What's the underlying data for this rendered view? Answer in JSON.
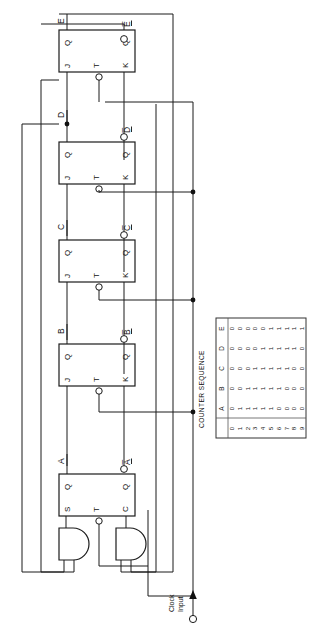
{
  "figure": {
    "orientation": "rotated-90"
  },
  "clock": {
    "label_line1": "Clock",
    "label_line2": "Input"
  },
  "stages": [
    {
      "id": "A",
      "type": "STC",
      "q_label": "A",
      "qbar_label": "A̅",
      "pins": {
        "in1": "S",
        "trigger": "T",
        "in2": "C",
        "out_q": "Q",
        "out_qbar": "Q"
      },
      "gates": [
        "and-gate-set",
        "and-gate-clear"
      ]
    },
    {
      "id": "B",
      "type": "JTK",
      "q_label": "B",
      "qbar_label": "B̅",
      "pins": {
        "in1": "J",
        "trigger": "T",
        "in2": "K",
        "out_q": "Q",
        "out_qbar": "Q"
      }
    },
    {
      "id": "C",
      "type": "JTK",
      "q_label": "C",
      "qbar_label": "C̅",
      "pins": {
        "in1": "J",
        "trigger": "T",
        "in2": "K",
        "out_q": "Q",
        "out_qbar": "Q"
      }
    },
    {
      "id": "D",
      "type": "JTK",
      "q_label": "D",
      "qbar_label": "D̅",
      "pins": {
        "in1": "J",
        "trigger": "T",
        "in2": "K",
        "out_q": "Q",
        "out_qbar": "Q"
      }
    },
    {
      "id": "E",
      "type": "JTK",
      "q_label": "E",
      "qbar_label": "E̅",
      "pins": {
        "in1": "J",
        "trigger": "T",
        "in2": "K",
        "out_q": "Q",
        "out_qbar": "Q"
      }
    }
  ],
  "table": {
    "caption": "COUNTER SEQUENCE",
    "count_header": "",
    "columns": [
      "A",
      "B",
      "C",
      "D",
      "E"
    ],
    "counts": [
      "0",
      "1",
      "2",
      "3",
      "4",
      "5",
      "6",
      "7",
      "8",
      "9"
    ],
    "rows": [
      {
        "count": "0",
        "A": "0",
        "B": "0",
        "C": "0",
        "D": "0",
        "E": "0"
      },
      {
        "count": "1",
        "A": "1",
        "B": "0",
        "C": "0",
        "D": "0",
        "E": "0"
      },
      {
        "count": "2",
        "A": "1",
        "B": "1",
        "C": "0",
        "D": "0",
        "E": "0"
      },
      {
        "count": "3",
        "A": "1",
        "B": "1",
        "C": "1",
        "D": "0",
        "E": "0"
      },
      {
        "count": "4",
        "A": "1",
        "B": "1",
        "C": "1",
        "D": "1",
        "E": "0"
      },
      {
        "count": "5",
        "A": "1",
        "B": "1",
        "C": "1",
        "D": "1",
        "E": "1"
      },
      {
        "count": "6",
        "A": "0",
        "B": "1",
        "C": "1",
        "D": "1",
        "E": "1"
      },
      {
        "count": "7",
        "A": "0",
        "B": "0",
        "C": "1",
        "D": "1",
        "E": "1"
      },
      {
        "count": "8",
        "A": "0",
        "B": "0",
        "C": "0",
        "D": "1",
        "E": "1"
      },
      {
        "count": "9",
        "A": "0",
        "B": "0",
        "C": "0",
        "D": "0",
        "E": "1"
      }
    ]
  },
  "colors": {
    "ink": "#1b1b1b",
    "paper": "#ffffff",
    "table_rule": "#555555"
  }
}
